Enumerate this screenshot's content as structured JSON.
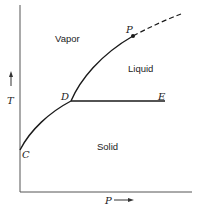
{
  "diagram": {
    "type": "phase-diagram",
    "axes": {
      "y_label": "T",
      "x_label": "P",
      "y_arrow": "↑",
      "x_arrow": "⟶"
    },
    "regions": {
      "vapor": "Vapor",
      "liquid": "Liquid",
      "solid": "Solid"
    },
    "points": {
      "C": "C",
      "D": "D",
      "E": "E",
      "P": "P"
    },
    "colors": {
      "line": "#1a1a1a",
      "axis": "#555555",
      "background": "#ffffff"
    }
  }
}
